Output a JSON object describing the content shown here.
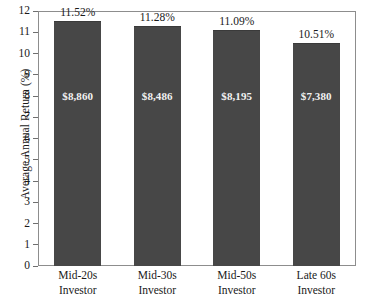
{
  "chart_data": {
    "type": "bar",
    "title": "",
    "xlabel": "",
    "ylabel": "Average Annual Return (%)",
    "ylim": [
      0,
      12
    ],
    "y_ticks": [
      0,
      1,
      2,
      3,
      4,
      5,
      6,
      7,
      8,
      9,
      10,
      11,
      12
    ],
    "grid": false,
    "legend": "none",
    "categories": [
      "Mid-20s Investor",
      "Mid-30s Investor",
      "Mid-50s Investor",
      "Late 60s Investor"
    ],
    "category_lines": [
      [
        "Mid-20s",
        "Investor"
      ],
      [
        "Mid-30s",
        "Investor"
      ],
      [
        "Mid-50s",
        "Investor"
      ],
      [
        "Late 60s",
        "Investor"
      ]
    ],
    "values": [
      11.52,
      11.28,
      11.09,
      10.51
    ],
    "value_labels": [
      "11.52%",
      "11.28%",
      "11.09%",
      "10.51%"
    ],
    "bar_inner_labels": [
      "$8,860",
      "$8,486",
      "$8,195",
      "$7,380"
    ],
    "bar_color": "#474747",
    "bar_edge_color": "#3a3a3a",
    "inner_label_color": "#f2f2f2",
    "axis_color": "#8d8d8d",
    "text_color": "#1a1a1a",
    "background": "#ffffff"
  }
}
